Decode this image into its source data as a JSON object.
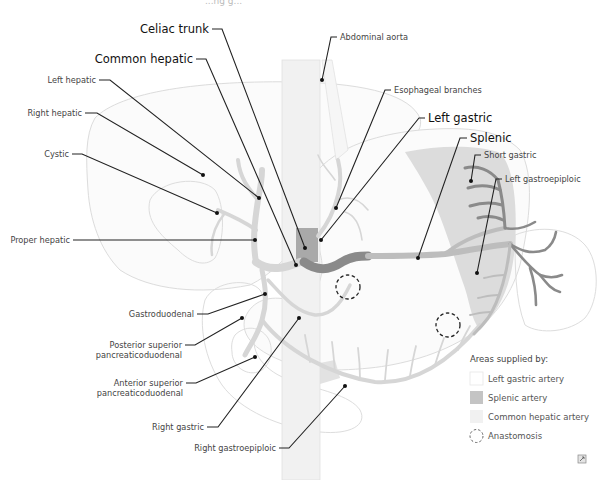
{
  "top_partial_text": "...ng g...",
  "labels": {
    "celiac_trunk": "Celiac trunk",
    "common_hepatic": "Common hepatic",
    "left_hepatic": "Left hepatic",
    "right_hepatic": "Right hepatic",
    "cystic": "Cystic",
    "proper_hepatic": "Proper hepatic",
    "gastroduodenal": "Gastroduodenal",
    "posterior_sup_pd_1": "Posterior superior",
    "posterior_sup_pd_2": "pancreaticoduodenal",
    "anterior_sup_pd_1": "Anterior superior",
    "anterior_sup_pd_2": "pancreaticoduodenal",
    "right_gastric": "Right gastric",
    "right_gastroepiploic": "Right gastroepiploic",
    "abdominal_aorta": "Abdominal aorta",
    "esophageal_branches": "Esophageal branches",
    "left_gastric": "Left gastric",
    "splenic": "Splenic",
    "short_gastric": "Short gastric",
    "left_gastroepiploic": "Left gastroepiploic"
  },
  "legend": {
    "title": "Areas supplied by:",
    "items": [
      {
        "label": "Left gastric artery",
        "swatch": "#ffffff",
        "type": "square"
      },
      {
        "label": "Splenic artery",
        "swatch": "#c4c4c4",
        "type": "square"
      },
      {
        "label": "Common hepatic artery",
        "swatch": "#f1f1f1",
        "type": "square"
      },
      {
        "label": "Anastomosis",
        "swatch": "none",
        "type": "dashed-circle"
      }
    ]
  },
  "colors": {
    "splenic_area": "#d9d9d9",
    "hepatic_area": "#f3f3f3",
    "dark_artery": "#8a8a8a",
    "light_artery": "#d6d6d6",
    "leader": "#222222"
  },
  "icons": {
    "corner_icon": "expand-icon"
  }
}
